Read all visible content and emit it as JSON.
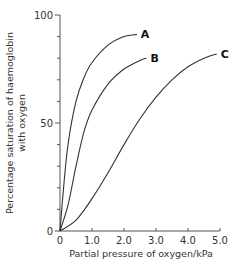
{
  "chart_data": {
    "type": "line",
    "title": "",
    "xlabel": "Partial pressure of oxygen/kPa",
    "ylabel_lines": [
      "Percentage saturation of haemoglobin",
      "with oxygen"
    ],
    "xlim": [
      0,
      5.0
    ],
    "ylim": [
      0,
      100
    ],
    "x_ticks": [
      "0",
      "1.0",
      "2.0",
      "3.0",
      "4.0",
      "5.0"
    ],
    "y_ticks": [
      "0",
      "50",
      "100"
    ],
    "y_minor_tick_step": 10,
    "grid": false,
    "legend": "direct labels at curve ends",
    "series": [
      {
        "name": "A",
        "x": [
          0,
          0.1,
          0.25,
          0.5,
          0.75,
          1.0,
          1.5,
          2.0,
          2.4
        ],
        "y": [
          0,
          18,
          40,
          60,
          71,
          78,
          86,
          90,
          91
        ]
      },
      {
        "name": "B",
        "x": [
          0,
          0.25,
          0.5,
          0.75,
          1.0,
          1.5,
          2.0,
          2.5,
          2.7
        ],
        "y": [
          0,
          12,
          30,
          46,
          56,
          68,
          75,
          79,
          80
        ]
      },
      {
        "name": "C",
        "x": [
          0,
          0.5,
          1.0,
          1.5,
          2.0,
          2.5,
          3.0,
          3.5,
          4.0,
          4.5,
          4.9
        ],
        "y": [
          0,
          5,
          15,
          27,
          40,
          52,
          62,
          70,
          76,
          80,
          82
        ]
      }
    ]
  }
}
